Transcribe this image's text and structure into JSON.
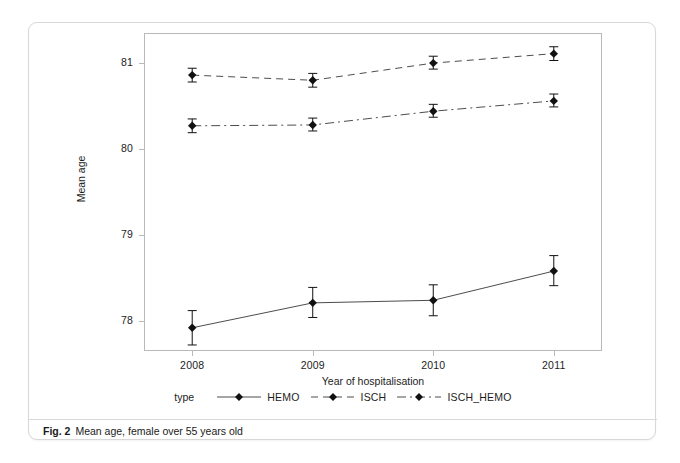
{
  "figure": {
    "caption_label": "Fig. 2",
    "caption_text": "Mean age, female over 55 years old"
  },
  "axes": {
    "y_title": "Mean age",
    "x_title": "Year of hospitalisation",
    "y_ticks": [
      "78",
      "79",
      "80",
      "81"
    ],
    "x_ticks": [
      "2008",
      "2009",
      "2010",
      "2011"
    ]
  },
  "legend": {
    "title": "type",
    "entries": [
      {
        "label": "HEMO",
        "dash": "solid"
      },
      {
        "label": "ISCH",
        "dash": "dashed"
      },
      {
        "label": "ISCH_HEMO",
        "dash": "dashdot"
      }
    ]
  },
  "colors": {
    "line": "#4d4d4d",
    "marker": "#111111",
    "frame": "#b9b9b9",
    "card_border": "#d8d8d8",
    "text": "#1d1d1d"
  },
  "chart_data": {
    "type": "line",
    "title": "Mean age, female over 55 years old",
    "xlabel": "Year of hospitalisation",
    "ylabel": "Mean age",
    "legend_title": "type",
    "legend_position": "bottom",
    "grid": false,
    "categories": [
      "2008",
      "2009",
      "2010",
      "2011"
    ],
    "x": [
      2008,
      2009,
      2010,
      2011
    ],
    "xlim": [
      2007.6,
      2011.4
    ],
    "ylim": [
      77.65,
      81.35
    ],
    "error_bars": "95% CI",
    "series": [
      {
        "name": "HEMO",
        "dash": "solid",
        "values": [
          77.92,
          78.21,
          78.24,
          78.58
        ],
        "ci_low": [
          77.72,
          78.04,
          78.06,
          78.41
        ],
        "ci_high": [
          78.12,
          78.39,
          78.42,
          78.76
        ]
      },
      {
        "name": "ISCH",
        "dash": "dashed",
        "values": [
          80.86,
          80.8,
          81.0,
          81.11
        ],
        "ci_low": [
          80.78,
          80.72,
          80.93,
          81.03
        ],
        "ci_high": [
          80.94,
          80.88,
          81.08,
          81.19
        ]
      },
      {
        "name": "ISCH_HEMO",
        "dash": "dashdot",
        "values": [
          80.27,
          80.28,
          80.44,
          80.56
        ],
        "ci_low": [
          80.19,
          80.21,
          80.37,
          80.49
        ],
        "ci_high": [
          80.35,
          80.36,
          80.52,
          80.64
        ]
      }
    ]
  }
}
